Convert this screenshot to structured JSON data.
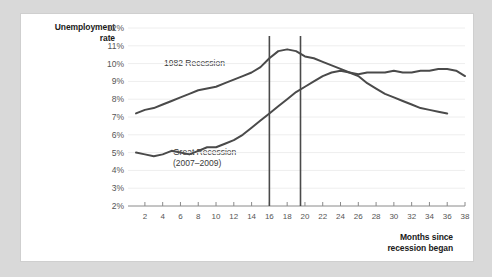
{
  "chart_data": {
    "type": "line",
    "title": "",
    "ylabel": "Unemployment rate",
    "xlabel": "Months since recession began",
    "ylim": [
      2,
      12
    ],
    "xlim": [
      1,
      38
    ],
    "grid": true,
    "legend": "inline-annotations",
    "ytick_labels": [
      "12%",
      "11%",
      "10%",
      "9%",
      "8%",
      "7%",
      "6%",
      "5%",
      "4%",
      "3%",
      "2%"
    ],
    "ytick_values": [
      12,
      11,
      10,
      9,
      8,
      7,
      6,
      5,
      4,
      3,
      2
    ],
    "xtick_labels": [
      "2",
      "4",
      "6",
      "8",
      "10",
      "12",
      "14",
      "16",
      "18",
      "20",
      "22",
      "24",
      "26",
      "28",
      "30",
      "32",
      "34",
      "36",
      "38"
    ],
    "xtick_values": [
      2,
      4,
      6,
      8,
      10,
      12,
      14,
      16,
      18,
      20,
      22,
      24,
      26,
      28,
      30,
      32,
      34,
      36,
      38
    ],
    "annotations": [
      {
        "name": "marker-line-1",
        "x": 16,
        "type": "vertical-line"
      },
      {
        "name": "marker-line-2",
        "x": 19.5,
        "type": "vertical-line"
      }
    ],
    "series": [
      {
        "name": "1982 Recession",
        "label": "1982 Recession",
        "color": "#4a4a4a",
        "x": [
          1,
          2,
          3,
          4,
          5,
          6,
          7,
          8,
          9,
          10,
          11,
          12,
          13,
          14,
          15,
          16,
          17,
          18,
          19,
          20,
          21,
          22,
          23,
          24,
          25,
          26,
          27,
          28,
          29,
          30,
          31,
          32,
          33,
          34,
          35,
          36
        ],
        "values": [
          7.2,
          7.4,
          7.5,
          7.7,
          7.9,
          8.1,
          8.3,
          8.5,
          8.6,
          8.7,
          8.9,
          9.1,
          9.3,
          9.5,
          9.8,
          10.3,
          10.7,
          10.8,
          10.7,
          10.4,
          10.3,
          10.1,
          9.9,
          9.7,
          9.5,
          9.3,
          8.9,
          8.6,
          8.3,
          8.1,
          7.9,
          7.7,
          7.5,
          7.4,
          7.3,
          7.2
        ]
      },
      {
        "name": "Great Recession",
        "label": "Great Recession",
        "sublabel": "(2007–2009)",
        "color": "#4a4a4a",
        "x": [
          1,
          2,
          3,
          4,
          5,
          6,
          7,
          8,
          9,
          10,
          11,
          12,
          13,
          14,
          15,
          16,
          17,
          18,
          19,
          20,
          21,
          22,
          23,
          24,
          25,
          26,
          27,
          28,
          29,
          30,
          31,
          32,
          33,
          34,
          35,
          36,
          37,
          38
        ],
        "values": [
          5.0,
          4.9,
          4.8,
          4.9,
          5.1,
          5.0,
          4.9,
          5.1,
          5.3,
          5.3,
          5.5,
          5.7,
          6.0,
          6.4,
          6.8,
          7.2,
          7.6,
          8.0,
          8.4,
          8.7,
          9.0,
          9.3,
          9.5,
          9.6,
          9.5,
          9.4,
          9.5,
          9.5,
          9.5,
          9.6,
          9.5,
          9.5,
          9.6,
          9.6,
          9.7,
          9.7,
          9.6,
          9.3
        ]
      }
    ]
  },
  "axes": {
    "y_title_line1": "Unemployment",
    "y_title_line2": "rate",
    "x_title_line1": "Months since",
    "x_title_line2": "recession began"
  },
  "colors": {
    "background": "#d9d9d9",
    "card": "#ffffff",
    "line": "#4a4a4a",
    "grid": "#eeeeee",
    "axis": "#8a8a8a",
    "tick_text": "#555555",
    "title_text": "#1a1a1a"
  }
}
